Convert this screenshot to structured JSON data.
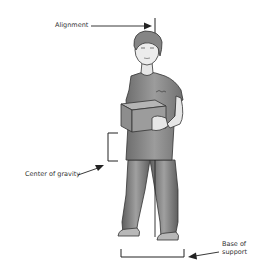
{
  "diagram": {
    "type": "annotated-illustration",
    "labels": {
      "alignment": "Alignment",
      "center_of_gravity": "Center of gravity",
      "base_of_support_line1": "Base of",
      "base_of_support_line2": "support"
    },
    "colors": {
      "line": "#222222",
      "text": "#333333",
      "shirt": "#8a8a8a",
      "pants": "#7a7a7a",
      "skin": "#e6e6e6",
      "hair": "#777777",
      "box": "#9a9a9a",
      "shoes": "#b0b0b0"
    }
  }
}
